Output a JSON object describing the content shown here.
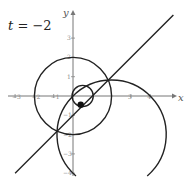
{
  "figure": {
    "parameter": {
      "name": "t",
      "equals": "=",
      "value": "−2"
    },
    "axes": {
      "x_label": "x",
      "y_label": "y",
      "origin_px": [
        73,
        96
      ],
      "unit_px": 19.3,
      "x_ticks": [
        {
          "value": -3,
          "label": "−3"
        },
        {
          "value": -2,
          "label": "−2"
        },
        {
          "value": -1,
          "label": "−1"
        },
        {
          "value": 3,
          "label": "3"
        },
        {
          "value": 4,
          "label": "4"
        }
      ],
      "y_ticks": [
        {
          "value": 3,
          "label": "3"
        },
        {
          "value": 2,
          "label": "2"
        },
        {
          "value": 1,
          "label": "1"
        },
        {
          "value": -1,
          "label": "−1"
        },
        {
          "value": -2,
          "label": "−2"
        },
        {
          "value": -3,
          "label": "−3"
        },
        {
          "value": -4,
          "label": "−4"
        }
      ]
    },
    "curves": [
      {
        "type": "circle",
        "name": "circle-radius-2",
        "center": [
          0,
          0
        ],
        "radius": 2
      },
      {
        "type": "circle",
        "name": "small-circle",
        "center": [
          0.5,
          0
        ],
        "radius": 0.55
      },
      {
        "type": "arc",
        "name": "large-arc",
        "center": [
          2,
          -2
        ],
        "radius": 2.83
      },
      {
        "type": "line",
        "name": "line-y-equals-x-minus-1",
        "equation": "y = x - 1"
      }
    ],
    "point": {
      "name": "moving-point",
      "coords": [
        0.4,
        -0.45
      ]
    },
    "colors": {
      "stroke": "#222222",
      "axis": "#777777",
      "tick_label": "#888888"
    }
  }
}
